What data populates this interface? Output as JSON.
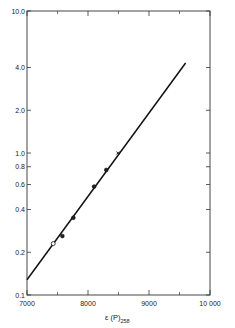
{
  "chart_data": {
    "type": "scatter",
    "title": "",
    "xlabel": "ε (P)",
    "xlabel_subscript": "258",
    "ylabel": "",
    "x_scale": "linear",
    "y_scale": "log",
    "xlim": [
      7000,
      10000
    ],
    "ylim": [
      0.1,
      10.0
    ],
    "x_ticks": [
      7000,
      8000,
      9000,
      10000
    ],
    "x_tick_labels": [
      "7000",
      "8000",
      "9000",
      "10 000"
    ],
    "x_minor_ticks": [
      7500,
      8500,
      9500
    ],
    "y_ticks": [
      0.1,
      0.2,
      0.4,
      0.6,
      0.8,
      1.0,
      2.0,
      4.0,
      10.0
    ],
    "y_tick_labels": [
      "0.1",
      "0.2",
      "0.4",
      "0.6",
      "0.8",
      "1.0",
      "2.0",
      "4.0",
      "10.0"
    ],
    "grid": false,
    "legend": null,
    "series": [
      {
        "name": "open points",
        "marker": "open-circle",
        "points": [
          {
            "x": 7430,
            "y": 0.23
          }
        ]
      },
      {
        "name": "filled points",
        "marker": "filled-circle",
        "points": [
          {
            "x": 7580,
            "y": 0.26
          },
          {
            "x": 7760,
            "y": 0.35
          },
          {
            "x": 8100,
            "y": 0.58
          },
          {
            "x": 8300,
            "y": 0.76
          }
        ]
      },
      {
        "name": "cross point",
        "marker": "tick",
        "points": [
          {
            "x": 8490,
            "y": 1.0
          }
        ]
      },
      {
        "name": "fit line",
        "type": "line",
        "points": [
          {
            "x": 7000,
            "y": 0.128
          },
          {
            "x": 9600,
            "y": 4.3
          }
        ]
      }
    ]
  }
}
